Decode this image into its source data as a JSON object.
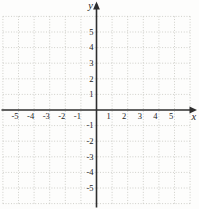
{
  "figure": {
    "background_color": "#fdfdfc",
    "grid_color": "#c6c6bf",
    "axis_color": "#2e2e2e",
    "label_color": "#1c1c1c"
  },
  "chart_data": {
    "type": "scatter",
    "title": "",
    "xlabel": "x",
    "ylabel": "y",
    "xlim": [
      -6,
      6
    ],
    "ylim": [
      -6,
      6
    ],
    "x_ticks": [
      -5,
      -4,
      -3,
      -2,
      -1,
      1,
      2,
      3,
      4,
      5
    ],
    "y_ticks": [
      -5,
      -4,
      -3,
      -2,
      -1,
      1,
      2,
      3,
      4,
      5
    ],
    "grid": "dotted",
    "legend": "none",
    "series": []
  }
}
